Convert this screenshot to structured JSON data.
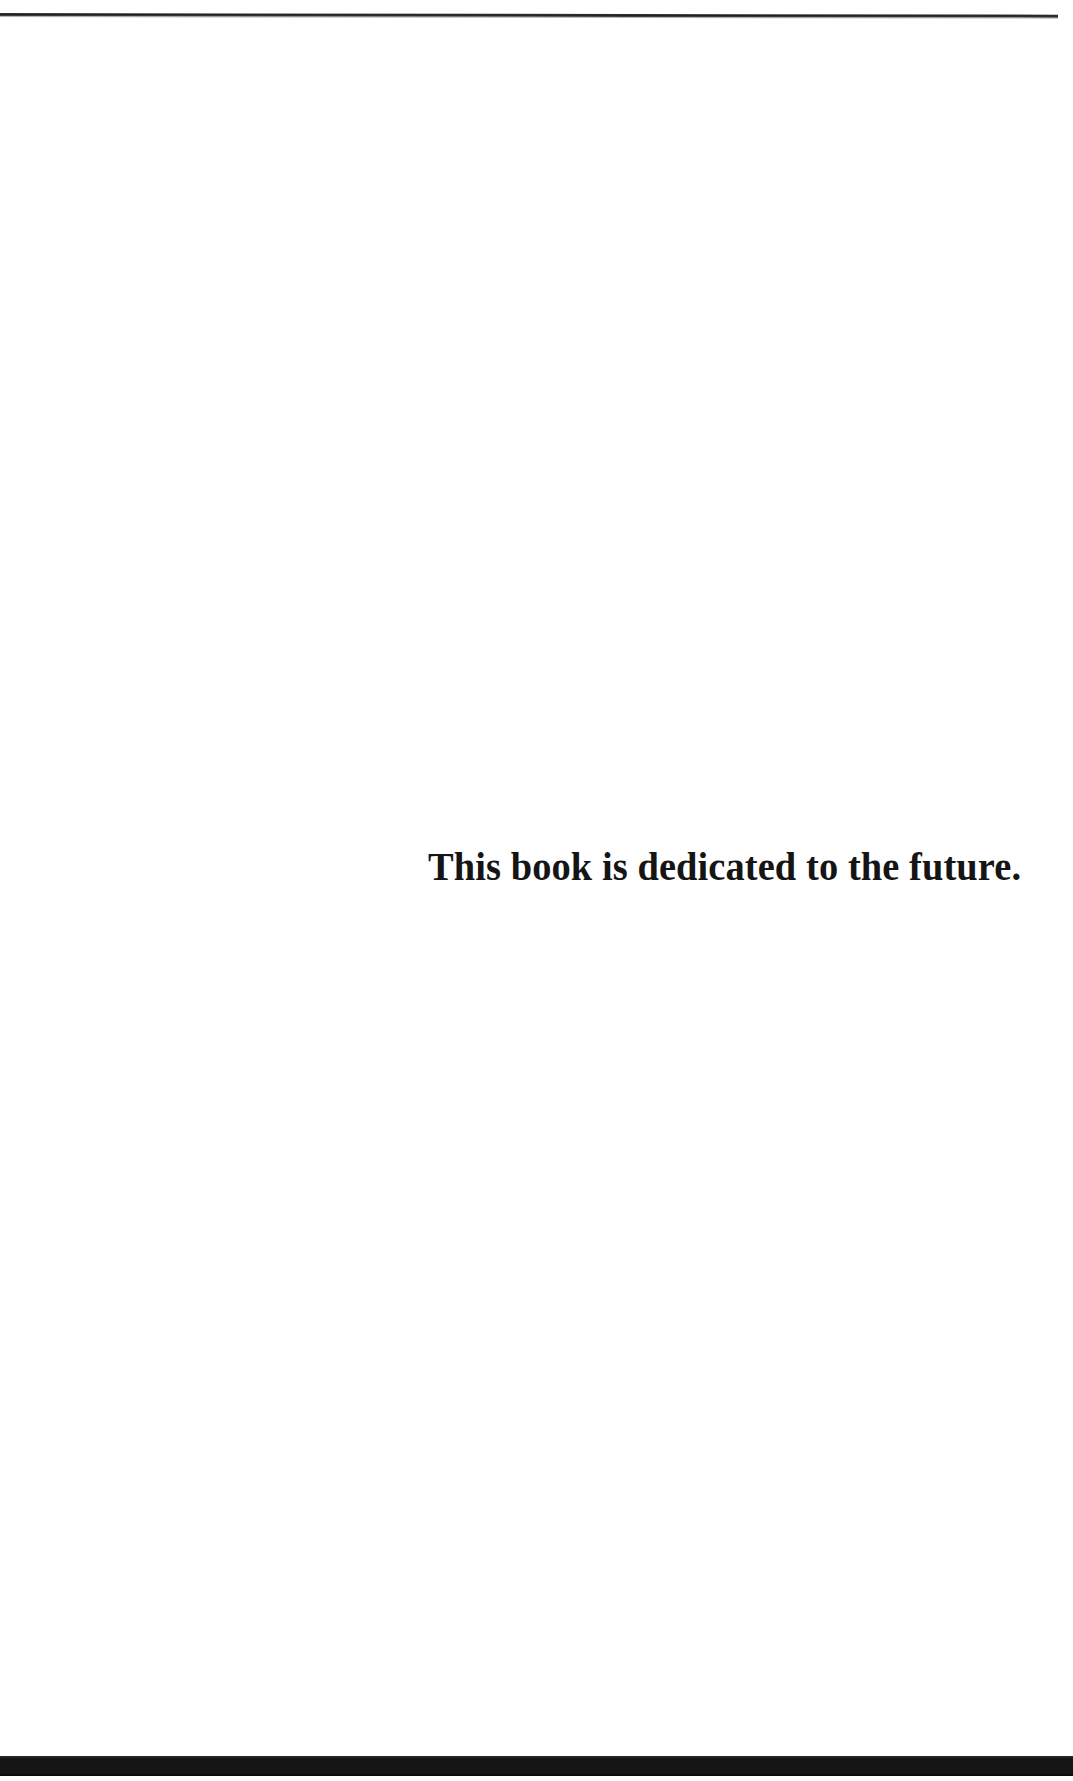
{
  "page": {
    "width": 1073,
    "height": 1781,
    "background_color": "#ffffff",
    "kind": "book-dedication-page"
  },
  "rules": {
    "top_rule": {
      "color": "#1f1f1f",
      "thickness_px": 3,
      "left_px": 0,
      "top_px": 13,
      "width_px": 1058
    },
    "bottom_bar": {
      "color": "#151515",
      "height_px": 20,
      "top_px": 1756,
      "width_px": 1073
    }
  },
  "content": {
    "dedication": "This book is dedicated to the future.",
    "text_color": "#151515",
    "font_size_px": 39,
    "font_weight": "bold",
    "alignment": "right",
    "left_px": 531,
    "right_px": 1016,
    "baseline_y_px": 882
  }
}
